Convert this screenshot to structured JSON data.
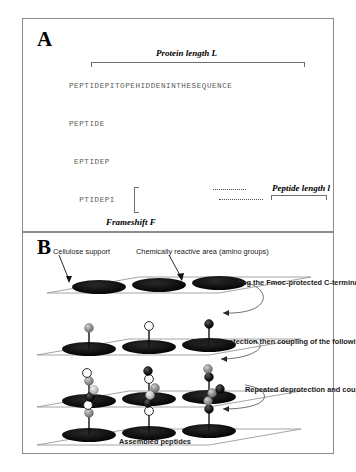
{
  "figure": {
    "panel_a": {
      "letter": "A",
      "protein_length_label": "Protein length L",
      "peptide_length_label": "Peptide length l",
      "frameshift_label": "Frameshift F",
      "full_sequence": "PEPTIDEPITOPEHIDDENINTHESEQUENCE",
      "peptide_ladder": [
        "PEPTIDEPITOPEHIDDENINTHESEQUENCE",
        "PEPTIDE",
        " EPTIDEP",
        "  PTIDEPI",
        "   TIDEPIT",
        "    IDEPITO",
        "     DEPITOP",
        "      EPITOPE",
        "       PITOPEH",
        "        PITOPEHI"
      ],
      "tail_peptides": [
        "ESEQUEN",
        " SEQUENC",
        "  EQUENCE"
      ]
    },
    "panel_b": {
      "letter": "B",
      "cellulose_label": "Cellulose support",
      "reactive_label": "Chemically reactive area (amino groups)",
      "step1_label": "Coupling  the  Fmoc-protected C-terminal residue",
      "step2_label": "Fmoc deprotection then coupling  of the following  residue",
      "step3_label": "Repeated deprotection and coupling steps",
      "assembled_label": "Assembled peptides",
      "rows": [
        {
          "name": "bare-support",
          "beads": []
        },
        {
          "name": "first-residue",
          "beads": [
            "gray",
            "white",
            "black"
          ]
        },
        {
          "name": "second-residue",
          "beads": [
            "white-gray",
            "black-white",
            "gray-black"
          ]
        },
        {
          "name": "full-peptide",
          "beads": [
            "chain-1",
            "chain-2",
            "chain-3"
          ]
        }
      ]
    }
  },
  "colors": {
    "panel_border": "#8c8c8c",
    "sequence_text": "#5a5a5a",
    "label_text": "#000000",
    "bead_dark": "#1a1a1a",
    "bead_gray": "#8f8f8f",
    "bead_light": "#c9c9c9",
    "bead_white": "#ffffff",
    "support_fill": "#0d0d0d",
    "plane_line": "#9a9a9a"
  }
}
